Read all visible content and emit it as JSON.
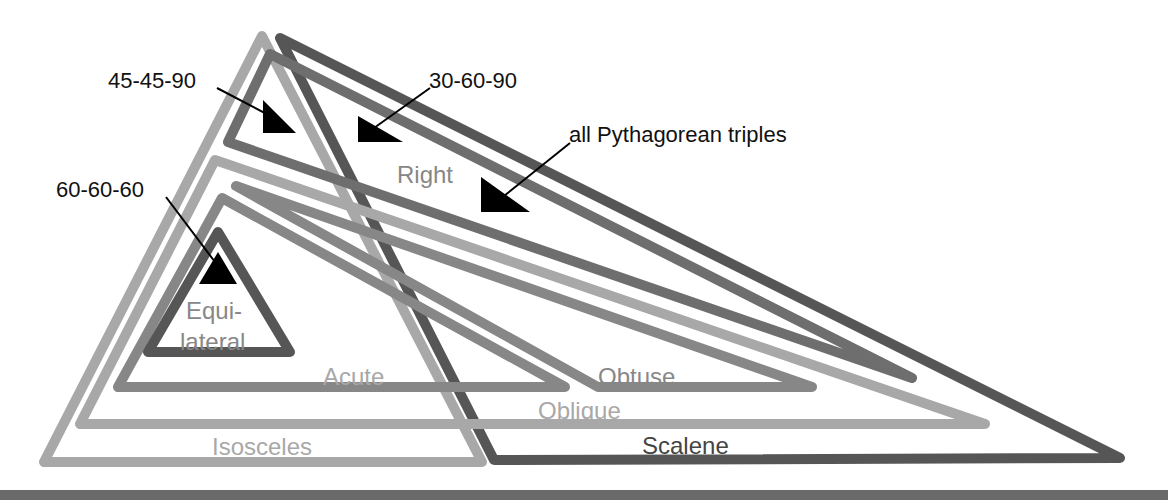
{
  "diagram": {
    "colors": {
      "light": "#a8a8a8",
      "medium": "#878787",
      "medium_dark": "#6e6e6e",
      "dark": "#565656",
      "annotation": "#000000",
      "bottom_bar": "#6a6a6a"
    },
    "regions": {
      "isosceles": "Isosceles",
      "scalene": "Scalene",
      "right": "Right",
      "oblique": "Oblique",
      "acute": "Acute",
      "obtuse": "Obtuse",
      "equilateral_line1": "Equi-",
      "equilateral_line2": "lateral"
    },
    "annotations": {
      "a45_45_90": "45-45-90",
      "a30_60_90": "30-60-90",
      "pythagorean": "all Pythagorean triples",
      "a60_60_60": "60-60-60"
    }
  }
}
